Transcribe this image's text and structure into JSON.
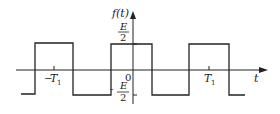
{
  "figure": {
    "type": "square-wave",
    "y_axis_label": "f(t)",
    "x_axis_label": "t",
    "origin_label": "0",
    "upper_level": {
      "numerator": "E",
      "denominator": "2"
    },
    "lower_level": {
      "sign": "-",
      "numerator": "E",
      "denominator": "2"
    },
    "tick_labels": {
      "neg_period": {
        "sign": "−",
        "symbol": "T",
        "subscript": "1"
      },
      "pos_period": {
        "symbol": "T",
        "subscript": "1"
      }
    }
  },
  "colors": {
    "line": "#222222",
    "background": "#ffffff"
  }
}
